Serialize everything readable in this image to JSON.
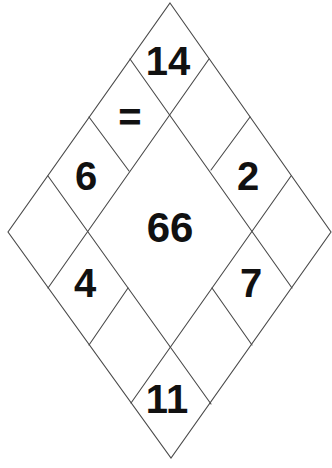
{
  "puzzle": {
    "type": "number diamond puzzle",
    "colors": {
      "background": "#ffffff",
      "lines": "#4a4a4a",
      "text": "#111111"
    },
    "cells": {
      "top": "14",
      "upper_left_1": "=",
      "upper_left_2": "6",
      "left_corner": "",
      "upper_right_1": "",
      "upper_right_2": "2",
      "right_corner": "",
      "lower_left_1": "4",
      "lower_left_2": "",
      "lower_right_1": "7",
      "lower_right_2": "",
      "bottom": "11",
      "center": "66"
    }
  }
}
